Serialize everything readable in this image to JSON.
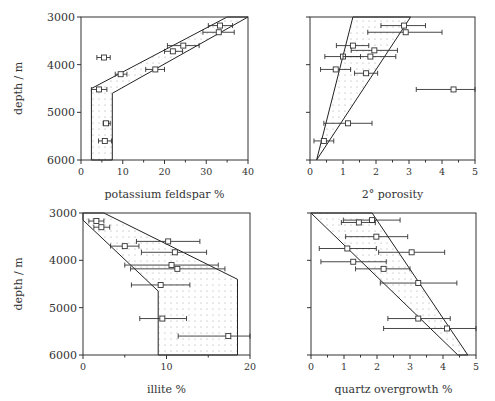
{
  "figure": {
    "ylabel": "depth / m",
    "colors": {
      "axis": "#333333",
      "line": "#222222",
      "dots": "#9a9a9a",
      "marker": "#333333"
    }
  },
  "chart_data": [
    {
      "type": "scatter",
      "title": "",
      "xlabel": "potassium feldspar %",
      "ylabel": "depth / m",
      "xlim": [
        0,
        40
      ],
      "ylim": [
        6000,
        3000
      ],
      "xticks": [
        0,
        10,
        20,
        30,
        40
      ],
      "yticks": [
        3000,
        4000,
        5000,
        6000
      ],
      "box": {
        "x": 81,
        "y": 17,
        "w": 167,
        "h": 143
      },
      "envelope": [
        [
          35,
          3000
        ],
        [
          2.5,
          4500
        ],
        [
          2.5,
          6000
        ],
        [
          7.5,
          6000
        ],
        [
          7.5,
          4600
        ],
        [
          40,
          3000
        ]
      ],
      "points": [
        {
          "x": 33.3,
          "y": 3180,
          "xmin": 30.5,
          "xmax": 36.3
        },
        {
          "x": 33.0,
          "y": 3320,
          "xmin": 29.2,
          "xmax": 36.7
        },
        {
          "x": 24.5,
          "y": 3600,
          "xmin": 20.7,
          "xmax": 28.3
        },
        {
          "x": 22.0,
          "y": 3720,
          "xmin": 20.0,
          "xmax": 24.3
        },
        {
          "x": 5.5,
          "y": 3850,
          "xmin": 3.8,
          "xmax": 7.0
        },
        {
          "x": 17.8,
          "y": 4100,
          "xmin": 15.5,
          "xmax": 20.0
        },
        {
          "x": 9.5,
          "y": 4200,
          "xmin": 8.2,
          "xmax": 11.0
        },
        {
          "x": 4.3,
          "y": 4520,
          "xmin": 2.5,
          "xmax": 6.2
        },
        {
          "x": 6.0,
          "y": 5230,
          "xmin": 5.3,
          "xmax": 7.0
        },
        {
          "x": 5.7,
          "y": 5600,
          "xmin": 4.2,
          "xmax": 7.3
        }
      ]
    },
    {
      "type": "scatter",
      "title": "",
      "xlabel": "2° porosity",
      "ylabel": "",
      "xlim": [
        0,
        5
      ],
      "ylim": [
        6000,
        3000
      ],
      "xticks": [
        0,
        1,
        2,
        3,
        4,
        5
      ],
      "yticks": [
        3000,
        4000,
        5000,
        6000
      ],
      "box": {
        "x": 310,
        "y": 17,
        "w": 165,
        "h": 143
      },
      "envelope": [
        [
          1.3,
          3000
        ],
        [
          0.2,
          6000
        ],
        [
          3.05,
          3000
        ]
      ],
      "points": [
        {
          "x": 2.85,
          "y": 3180,
          "xmin": 2.15,
          "xmax": 3.5
        },
        {
          "x": 2.9,
          "y": 3320,
          "xmin": 1.75,
          "xmax": 4.0
        },
        {
          "x": 1.3,
          "y": 3600,
          "xmin": 0.8,
          "xmax": 1.78
        },
        {
          "x": 1.95,
          "y": 3700,
          "xmin": 1.25,
          "xmax": 2.65
        },
        {
          "x": 1.0,
          "y": 3830,
          "xmin": 0.45,
          "xmax": 1.53
        },
        {
          "x": 1.83,
          "y": 3830,
          "xmin": 1.0,
          "xmax": 2.6
        },
        {
          "x": 0.78,
          "y": 4100,
          "xmin": 0.32,
          "xmax": 1.23
        },
        {
          "x": 1.7,
          "y": 4180,
          "xmin": 1.35,
          "xmax": 2.05
        },
        {
          "x": 4.35,
          "y": 4520,
          "xmin": 3.22,
          "xmax": 5.0
        },
        {
          "x": 1.15,
          "y": 5230,
          "xmin": 0.42,
          "xmax": 1.88
        },
        {
          "x": 0.42,
          "y": 5600,
          "xmin": 0.12,
          "xmax": 0.72
        }
      ]
    },
    {
      "type": "scatter",
      "title": "",
      "xlabel": "illite %",
      "ylabel": "depth / m",
      "xlim": [
        0,
        20
      ],
      "ylim": [
        6000,
        3000
      ],
      "xticks": [
        0,
        10,
        20
      ],
      "yticks": [
        3000,
        4000,
        5000,
        6000
      ],
      "box": {
        "x": 83,
        "y": 213,
        "w": 167,
        "h": 142
      },
      "envelope": [
        [
          0,
          3000
        ],
        [
          0,
          3150
        ],
        [
          9.0,
          4650
        ],
        [
          9.0,
          6000
        ],
        [
          18.5,
          6000
        ],
        [
          18.5,
          4400
        ],
        [
          2.5,
          3000
        ]
      ],
      "points": [
        {
          "x": 1.6,
          "y": 3170,
          "xmin": 0.7,
          "xmax": 2.5
        },
        {
          "x": 2.2,
          "y": 3300,
          "xmin": 1.3,
          "xmax": 3.2
        },
        {
          "x": 10.2,
          "y": 3600,
          "xmin": 6.4,
          "xmax": 14.0
        },
        {
          "x": 5.0,
          "y": 3700,
          "xmin": 3.3,
          "xmax": 6.7
        },
        {
          "x": 11.0,
          "y": 3830,
          "xmin": 7.0,
          "xmax": 14.8
        },
        {
          "x": 10.6,
          "y": 4100,
          "xmin": 5.0,
          "xmax": 16.2
        },
        {
          "x": 11.3,
          "y": 4180,
          "xmin": 5.7,
          "xmax": 17.0
        },
        {
          "x": 9.3,
          "y": 4520,
          "xmin": 5.8,
          "xmax": 12.8
        },
        {
          "x": 9.5,
          "y": 5230,
          "xmin": 6.8,
          "xmax": 12.4
        },
        {
          "x": 17.4,
          "y": 5600,
          "xmin": 11.4,
          "xmax": 20.0
        }
      ]
    },
    {
      "type": "scatter",
      "title": "",
      "xlabel": "quartz overgrowth %",
      "ylabel": "",
      "xlim": [
        0,
        5
      ],
      "ylim": [
        6000,
        3000
      ],
      "xticks": [
        0,
        1,
        2,
        3,
        4,
        5
      ],
      "yticks": [
        3000,
        4000,
        5000,
        6000
      ],
      "box": {
        "x": 311,
        "y": 213,
        "w": 165,
        "h": 142
      },
      "envelope": [
        [
          0,
          3000
        ],
        [
          4.45,
          6000
        ],
        [
          4.75,
          6000
        ],
        [
          1.85,
          3000
        ]
      ],
      "points": [
        {
          "x": 1.85,
          "y": 3150,
          "xmin": 0.98,
          "xmax": 2.7
        },
        {
          "x": 1.45,
          "y": 3200,
          "xmin": 0.92,
          "xmax": 1.95
        },
        {
          "x": 1.98,
          "y": 3500,
          "xmin": 1.05,
          "xmax": 2.93
        },
        {
          "x": 1.1,
          "y": 3750,
          "xmin": 0.25,
          "xmax": 1.98
        },
        {
          "x": 3.05,
          "y": 3830,
          "xmin": 2.05,
          "xmax": 4.05
        },
        {
          "x": 1.28,
          "y": 4030,
          "xmin": 0.3,
          "xmax": 2.28
        },
        {
          "x": 2.2,
          "y": 4180,
          "xmin": 1.35,
          "xmax": 3.0
        },
        {
          "x": 3.25,
          "y": 4480,
          "xmin": 2.1,
          "xmax": 4.42
        },
        {
          "x": 3.25,
          "y": 5230,
          "xmin": 2.33,
          "xmax": 4.22
        },
        {
          "x": 4.12,
          "y": 5440,
          "xmin": 2.2,
          "xmax": 5.0
        }
      ]
    }
  ]
}
